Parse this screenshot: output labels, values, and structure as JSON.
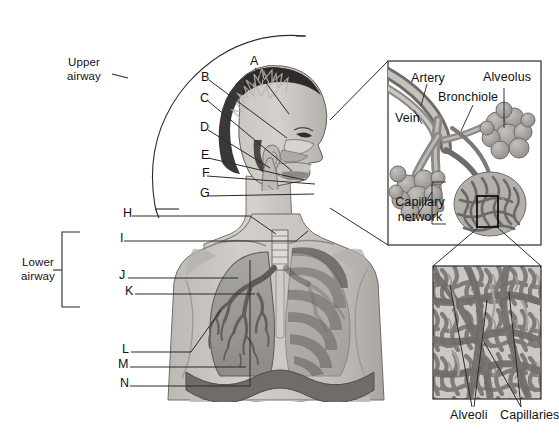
{
  "figure": {
    "type": "anatomical-diagram"
  },
  "brackets": {
    "upper": {
      "label_line1": "Upper",
      "label_line2": "airway"
    },
    "lower": {
      "label_line1": "Lower",
      "label_line2": "airway"
    }
  },
  "letters": [
    {
      "id": "A",
      "text": "A"
    },
    {
      "id": "B",
      "text": "B"
    },
    {
      "id": "C",
      "text": "C"
    },
    {
      "id": "D",
      "text": "D"
    },
    {
      "id": "E",
      "text": "E"
    },
    {
      "id": "F",
      "text": "F"
    },
    {
      "id": "G",
      "text": "G"
    },
    {
      "id": "H",
      "text": "H"
    },
    {
      "id": "I",
      "text": "I"
    },
    {
      "id": "J",
      "text": "J"
    },
    {
      "id": "K",
      "text": "K"
    },
    {
      "id": "L",
      "text": "L"
    },
    {
      "id": "M",
      "text": "M"
    },
    {
      "id": "N",
      "text": "N"
    }
  ],
  "inset_top": {
    "labels": {
      "artery": "Artery",
      "vein": "Vein",
      "bronchiole": "Bronchiole",
      "alveolus": "Alveolus",
      "capillary_line1": "Capillary",
      "capillary_line2": "network"
    }
  },
  "inset_bottom": {
    "labels": {
      "alveoli": "Alveoli",
      "capillaries": "Capillaries"
    }
  },
  "colors": {
    "line": "#2b2b2b",
    "skin": "#cfcbc6",
    "skin_shadow": "#b6b2ad",
    "hair": "#3d3b3a",
    "lung": "#9a9894",
    "lung_dark": "#7c7a77",
    "vessel_dark": "#6e6c6a",
    "vessel_light": "#b9b6b2",
    "background": "#ffffff"
  }
}
